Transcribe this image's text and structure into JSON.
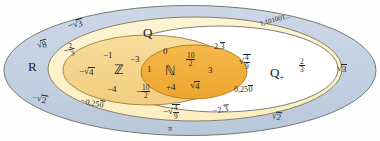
{
  "diagram": {
    "colors": {
      "real_fill": "#c5d2e2",
      "rational_fill": "#fdf2cf",
      "positive_rational_fill": "#ffffff",
      "integer_fill": "#f5d68a",
      "natural_fill": "#f0ad3c",
      "stroke": "#6b6f63",
      "text": "#1b2430",
      "background": "#fefefe"
    },
    "sets": [
      {
        "id": "R",
        "name": "R",
        "label": "R",
        "fill": "#c5d2e2",
        "description": "real numbers"
      },
      {
        "id": "Q",
        "name": "Q",
        "label": "Q",
        "fill": "#fdf2cf",
        "description": "rational numbers"
      },
      {
        "id": "Qp",
        "name": "Q+",
        "label": "Q",
        "sub": "+",
        "fill": "#ffffff",
        "description": "positive rational numbers"
      },
      {
        "id": "Z",
        "name": "Z",
        "label": "Z",
        "fill": "#f5d68a",
        "description": "integers"
      },
      {
        "id": "N",
        "name": "N",
        "label": "N",
        "fill": "#f0ad3c",
        "description": "natural numbers"
      }
    ],
    "elements": {
      "real_only": [
        {
          "text": "√8",
          "kind": "radical",
          "radicand": "8"
        },
        {
          "text": "-√2",
          "kind": "radical",
          "radicand": "2",
          "sign": "-"
        },
        {
          "text": "-√3",
          "kind": "radical",
          "radicand": "3",
          "sign": "-"
        },
        {
          "text": "√3",
          "kind": "radical",
          "radicand": "3"
        },
        {
          "text": "√2",
          "kind": "radical",
          "radicand": "2"
        },
        {
          "text": "π",
          "kind": "symbol"
        },
        {
          "text": "1,101001...",
          "kind": "decimal"
        }
      ],
      "rational_negative": [
        {
          "text": "-2/3",
          "kind": "fraction",
          "num": "2",
          "den": "3",
          "sign": "−"
        },
        {
          "text": "-0,250",
          "kind": "repeating_decimal",
          "head": "−0,25",
          "repeat": "0"
        }
      ],
      "positive_rational": [
        {
          "text": "2,3",
          "kind": "repeating_decimal",
          "head": "2,",
          "repeat": "3"
        },
        {
          "text": "√(4/9)",
          "kind": "radical_fraction",
          "num": "4",
          "den": "9"
        },
        {
          "text": "2/3",
          "kind": "fraction",
          "num": "2",
          "den": "3"
        },
        {
          "text": "0,250",
          "kind": "repeating_decimal",
          "head": "0,25",
          "repeat": "0"
        }
      ],
      "rational_boundary": [
        {
          "text": "-√(4/9)",
          "kind": "radical_fraction",
          "num": "4",
          "den": "9",
          "sign": "−"
        },
        {
          "text": "-2,3",
          "kind": "repeating_decimal",
          "head": "−2,",
          "repeat": "3"
        }
      ],
      "integers": [
        {
          "text": "-1",
          "kind": "integer"
        },
        {
          "text": "-3",
          "kind": "integer"
        },
        {
          "text": "-4",
          "kind": "integer"
        },
        {
          "text": "-√4",
          "kind": "radical",
          "radicand": "4",
          "sign": "−"
        },
        {
          "text": "-10/2",
          "kind": "fraction",
          "num": "10",
          "den": "2",
          "sign": "−"
        }
      ],
      "naturals": [
        {
          "text": "0",
          "kind": "integer"
        },
        {
          "text": "1",
          "kind": "integer"
        },
        {
          "text": "3",
          "kind": "integer"
        },
        {
          "text": "+4",
          "kind": "integer"
        },
        {
          "text": "10/2",
          "kind": "fraction",
          "num": "10",
          "den": "2"
        },
        {
          "text": "√4",
          "kind": "radical",
          "radicand": "4"
        }
      ]
    },
    "labels": {
      "sqrt_symbol": "√",
      "pi": "π",
      "minus": "−",
      "plus_sub": "+",
      "one_101001": "1,101001...",
      "set_R": "R",
      "set_Q": "Q",
      "set_Qplus": "Q",
      "set_Z": "ℤ",
      "set_N": "ℕ",
      "num_0": "0",
      "num_1": "1",
      "num_3": "3",
      "num_plus4": "+4",
      "num_neg1": "−1",
      "num_neg3": "−3",
      "num_neg4": "−4",
      "frac_10": "10",
      "frac_2": "2",
      "frac_2n": "2",
      "frac_3d": "3",
      "frac_4": "4",
      "frac_9": "9",
      "rad_8": "8",
      "rad_4": "4",
      "rad_2": "2",
      "rad_3": "3",
      "dec_0250_head": "0,25",
      "dec_0250_rep": "0",
      "dec_neg0250_head": "−0,25",
      "dec_neg0250_rep": "0",
      "dec_23_head": "2,",
      "dec_23_rep": "3",
      "dec_neg23_head": "−2,",
      "dec_neg23_rep": "3"
    }
  }
}
